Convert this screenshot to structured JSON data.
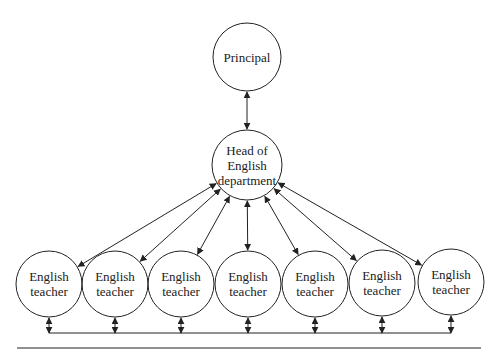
{
  "diagram": {
    "type": "org-chart",
    "nodes": {
      "principal": {
        "label": "Principal",
        "cx": 247,
        "cy": 57,
        "r": 34
      },
      "head": {
        "label_lines": [
          "Head of",
          "English",
          "department"
        ],
        "cx": 247,
        "cy": 165,
        "r": 35
      },
      "teachers": [
        {
          "label_lines": [
            "English",
            "teacher"
          ],
          "cx": 49,
          "cy": 284,
          "r": 33
        },
        {
          "label_lines": [
            "English",
            "teacher"
          ],
          "cx": 115,
          "cy": 284,
          "r": 33
        },
        {
          "label_lines": [
            "English",
            "teacher"
          ],
          "cx": 181,
          "cy": 284,
          "r": 33
        },
        {
          "label_lines": [
            "English",
            "teacher"
          ],
          "cx": 248,
          "cy": 284,
          "r": 33
        },
        {
          "label_lines": [
            "English",
            "teacher"
          ],
          "cx": 315,
          "cy": 284,
          "r": 33
        },
        {
          "label_lines": [
            "English",
            "teacher"
          ],
          "cx": 382,
          "cy": 283,
          "r": 33
        },
        {
          "label_lines": [
            "English",
            "teacher"
          ],
          "cx": 451,
          "cy": 282,
          "r": 33
        }
      ]
    },
    "edges": [
      {
        "from": "principal",
        "to": "head",
        "direction": "bidirectional"
      },
      {
        "from": "head",
        "to": "teacher-1",
        "direction": "bidirectional"
      },
      {
        "from": "head",
        "to": "teacher-2",
        "direction": "bidirectional"
      },
      {
        "from": "head",
        "to": "teacher-3",
        "direction": "bidirectional"
      },
      {
        "from": "head",
        "to": "teacher-4",
        "direction": "bidirectional"
      },
      {
        "from": "head",
        "to": "teacher-5",
        "direction": "bidirectional"
      },
      {
        "from": "head",
        "to": "teacher-6",
        "direction": "bidirectional"
      },
      {
        "from": "head",
        "to": "teacher-7",
        "direction": "bidirectional"
      }
    ],
    "bottom_connector": {
      "y": 333,
      "x_start": 49,
      "x_end": 451,
      "direction": "bidirectional-to-each-teacher"
    },
    "rule": {
      "y": 348,
      "x_start": 17,
      "x_end": 481
    },
    "colors": {
      "stroke": "#222222",
      "background": "#ffffff"
    }
  }
}
